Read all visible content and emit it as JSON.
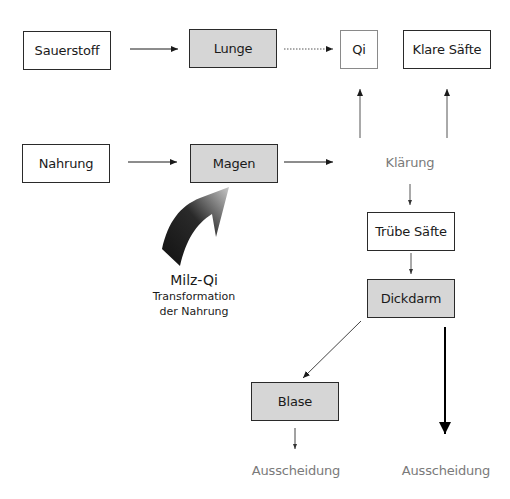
{
  "title_remnant": "",
  "colors": {
    "box_gray": "#d6d6d6",
    "box_border": "#2a2a2a",
    "muted_text": "#7a7a7a"
  },
  "nodes": {
    "sauerstoff": "Sauerstoff",
    "lunge": "Lunge",
    "qi": "Qi",
    "klare_saefte": "Klare Säfte",
    "nahrung": "Nahrung",
    "magen": "Magen",
    "klaerung": "Klärung",
    "truebe_saefte": "Trübe Säfte",
    "dickdarm": "Dickdarm",
    "blase": "Blase",
    "ausscheidung_left": "Ausscheidung",
    "ausscheidung_right": "Ausscheidung"
  },
  "milz_qi": {
    "title": "Milz-Qi",
    "line1": "Transformation",
    "line2": "der Nahrung",
    "icon": "curved-arrow-icon"
  },
  "edges": [
    {
      "from": "Sauerstoff",
      "to": "Lunge",
      "style": "solid"
    },
    {
      "from": "Lunge",
      "to": "Qi",
      "style": "dotted"
    },
    {
      "from": "Nahrung",
      "to": "Magen",
      "style": "solid"
    },
    {
      "from": "Magen",
      "to": "Klärung",
      "style": "solid"
    },
    {
      "from": "Klärung",
      "to": "Qi",
      "style": "solid"
    },
    {
      "from": "Klärung",
      "to": "Klare Säfte",
      "style": "solid"
    },
    {
      "from": "Klärung",
      "to": "Trübe Säfte",
      "style": "solid"
    },
    {
      "from": "Trübe Säfte",
      "to": "Dickdarm",
      "style": "solid"
    },
    {
      "from": "Dickdarm",
      "to": "Blase",
      "style": "solid"
    },
    {
      "from": "Dickdarm",
      "to": "Ausscheidung",
      "style": "bold"
    },
    {
      "from": "Blase",
      "to": "Ausscheidung",
      "style": "solid"
    }
  ]
}
